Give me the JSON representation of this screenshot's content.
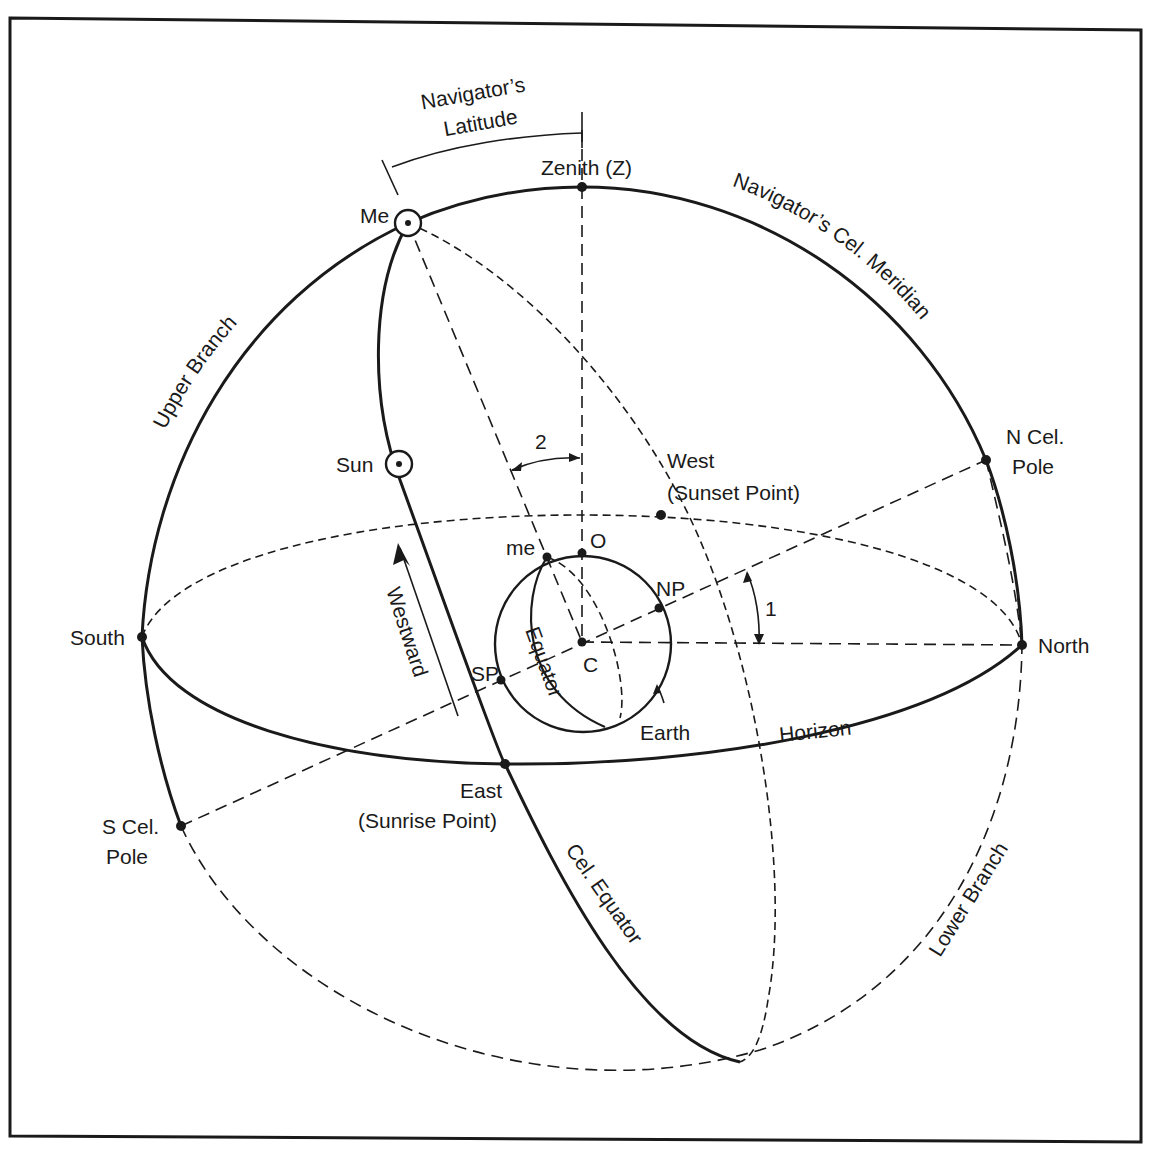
{
  "figure": {
    "type": "celestial sphere diagram",
    "stroke_color": "#1a1a1a",
    "background": "#ffffff"
  },
  "labels": {
    "navigators_latitude_line1": "Navigator’s",
    "navigators_latitude_line2": "Latitude",
    "zenith": "Zenith (Z)",
    "me": "Me",
    "navigators_cel_meridian": "Navigator’s Cel. Meridian",
    "upper_branch": "Upper Branch",
    "n_cel_pole_line1": "N Cel.",
    "n_cel_pole_line2": "Pole",
    "sun": "Sun",
    "angle_2": "2",
    "west_line1": "West",
    "west_line2": "(Sunset Point)",
    "me_small": "me",
    "o": "O",
    "np": "NP",
    "angle_1": "1",
    "south": "South",
    "north": "North",
    "westward": "Westward",
    "equator": "Equator",
    "sp": "SP",
    "c": "C",
    "earth": "Earth",
    "horizon": "Horizon",
    "east_line1": "East",
    "east_line2": "(Sunrise Point)",
    "s_cel_pole_line1": "S Cel.",
    "s_cel_pole_line2": "Pole",
    "cel_equator": "Cel. Equator",
    "lower_branch": "Lower Branch"
  }
}
